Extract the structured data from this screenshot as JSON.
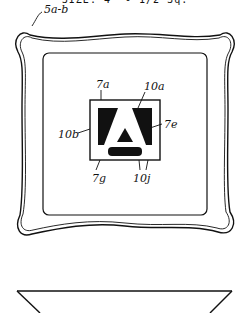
{
  "caption": "SIZE: 4\" - 1/2 Sq.",
  "labels": {
    "tray": "5a-b",
    "top_edge": "7a",
    "top_right": "10a",
    "left_side": "10b",
    "right_letter": "7e",
    "bottom_left": "7g",
    "bottom_right": "10j"
  },
  "figures": {
    "top_view": "tray-top-view",
    "side_view": "tray-side-view"
  },
  "colors": {
    "ink": "#111111",
    "paper": "#ffffff"
  }
}
